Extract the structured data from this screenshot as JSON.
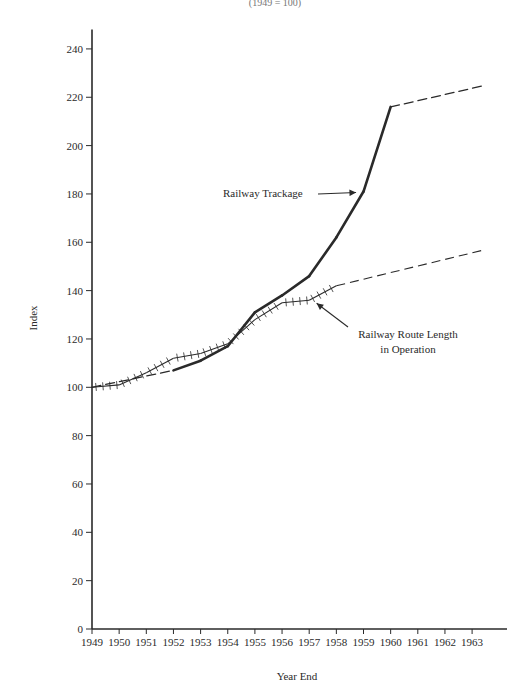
{
  "chart_data": {
    "type": "line",
    "title": "",
    "subtitle": "(1949 = 100)",
    "xlabel": "Year End",
    "ylabel": "Index",
    "x": [
      1949,
      1950,
      1951,
      1952,
      1953,
      1954,
      1955,
      1956,
      1957,
      1958,
      1959,
      1960,
      1961,
      1962,
      1963
    ],
    "x_tick_labels": [
      "1949",
      "1950",
      "1951",
      "1952",
      "1953",
      "1954",
      "1955",
      "1956",
      "1957",
      "1958",
      "1959",
      "1960",
      "1961",
      "1962",
      "1963"
    ],
    "y_ticks": [
      0,
      20,
      40,
      60,
      80,
      100,
      120,
      140,
      160,
      180,
      200,
      220,
      240
    ],
    "ylim": [
      0,
      248
    ],
    "xlim": [
      1949,
      1964.2
    ],
    "grid": false,
    "legend": "inline annotations with arrows",
    "series": [
      {
        "name": "Railway Trackage",
        "style": "thick solid (dashed before 1952 and after 1960)",
        "points": [
          {
            "x": 1949,
            "y": 100,
            "segment": "dashed"
          },
          {
            "x": 1952,
            "y": 107,
            "segment": "solid"
          },
          {
            "x": 1953,
            "y": 111,
            "segment": "solid"
          },
          {
            "x": 1954,
            "y": 117,
            "segment": "solid"
          },
          {
            "x": 1955,
            "y": 131,
            "segment": "solid"
          },
          {
            "x": 1956,
            "y": 138,
            "segment": "solid"
          },
          {
            "x": 1957,
            "y": 146,
            "segment": "solid"
          },
          {
            "x": 1958,
            "y": 162,
            "segment": "solid"
          },
          {
            "x": 1959,
            "y": 181,
            "segment": "solid"
          },
          {
            "x": 1960,
            "y": 216,
            "segment": "solid"
          },
          {
            "x": 1963.5,
            "y": 225,
            "segment": "dashed"
          }
        ]
      },
      {
        "name": "Railway Route Length in Operation",
        "style": "thin line with cross-hatch ticks (dashed after 1958)",
        "points": [
          {
            "x": 1949,
            "y": 100,
            "segment": "hatched"
          },
          {
            "x": 1950,
            "y": 101,
            "segment": "hatched"
          },
          {
            "x": 1951,
            "y": 106,
            "segment": "hatched"
          },
          {
            "x": 1952,
            "y": 112,
            "segment": "hatched"
          },
          {
            "x": 1953,
            "y": 114,
            "segment": "hatched"
          },
          {
            "x": 1954,
            "y": 118,
            "segment": "hatched"
          },
          {
            "x": 1955,
            "y": 128,
            "segment": "hatched"
          },
          {
            "x": 1956,
            "y": 135,
            "segment": "hatched"
          },
          {
            "x": 1957,
            "y": 136,
            "segment": "hatched"
          },
          {
            "x": 1958,
            "y": 142,
            "segment": "hatched"
          },
          {
            "x": 1963.5,
            "y": 157,
            "segment": "dashed"
          }
        ]
      }
    ],
    "annotations": [
      {
        "text": "Railway Trackage",
        "points_to": {
          "x": 1958.8,
          "y": 181
        }
      },
      {
        "text_lines": [
          "Railway Route Length",
          "in Operation"
        ],
        "points_to": {
          "x": 1957.2,
          "y": 136
        }
      }
    ]
  },
  "labels": {
    "subtitle": "(1949 = 100)",
    "xlabel": "Year End",
    "ylabel": "Index",
    "annot_trackage": "Railway Trackage",
    "annot_route_1": "Railway Route Length",
    "annot_route_2": "in Operation"
  },
  "colors": {
    "ink": "#2a2a2a",
    "background": "#ffffff"
  }
}
